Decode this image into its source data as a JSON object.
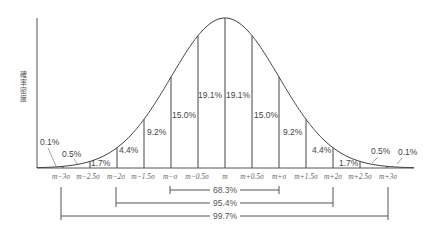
{
  "chart_data": {
    "type": "area",
    "title": "",
    "xlabel": "",
    "ylabel": "確率密度",
    "distribution": "normal",
    "x_ticks": [
      "m-3σ",
      "m-2.5σ",
      "m-2σ",
      "m-1.5σ",
      "m-σ",
      "m-0.5σ",
      "m",
      "m+0.5σ",
      "m+σ",
      "m+1.5σ",
      "m+2σ",
      "m+2.5σ",
      "m+3σ"
    ],
    "segments": [
      {
        "from": "<m-3σ",
        "to": "m-3σ",
        "percent": "0.1%"
      },
      {
        "from": "m-3σ",
        "to": "m-2.5σ",
        "percent": "0.5%"
      },
      {
        "from": "m-2.5σ",
        "to": "m-2σ",
        "percent": "1.7%"
      },
      {
        "from": "m-2σ",
        "to": "m-1.5σ",
        "percent": "4.4%"
      },
      {
        "from": "m-1.5σ",
        "to": "m-σ",
        "percent": "9.2%"
      },
      {
        "from": "m-σ",
        "to": "m-0.5σ",
        "percent": "15.0%"
      },
      {
        "from": "m-0.5σ",
        "to": "m",
        "percent": "19.1%"
      },
      {
        "from": "m",
        "to": "m+0.5σ",
        "percent": "19.1%"
      },
      {
        "from": "m+0.5σ",
        "to": "m+σ",
        "percent": "15.0%"
      },
      {
        "from": "m+σ",
        "to": "m+1.5σ",
        "percent": "9.2%"
      },
      {
        "from": "m+1.5σ",
        "to": "m+2σ",
        "percent": "4.4%"
      },
      {
        "from": "m+2σ",
        "to": "m+2.5σ",
        "percent": "1.7%"
      },
      {
        "from": "m+2.5σ",
        "to": "m+3σ",
        "percent": "0.5%"
      },
      {
        "from": "m+3σ",
        "to": ">m+3σ",
        "percent": "0.1%"
      }
    ],
    "ranges": [
      {
        "from": "m-σ",
        "to": "m+σ",
        "percent": "68.3%"
      },
      {
        "from": "m-2σ",
        "to": "m+2σ",
        "percent": "95.4%"
      },
      {
        "from": "m-3σ",
        "to": "m+3σ",
        "percent": "99.7%"
      }
    ],
    "grid": false,
    "legend": "none"
  },
  "labels": {
    "ylabel": "確率密度",
    "ticks": [
      "m−3σ",
      "m−2.5σ",
      "m−2σ",
      "m−1.5σ",
      "m−σ",
      "m−0.5σ",
      "m",
      "m+0.5σ",
      "m+σ",
      "m+1.5σ",
      "m+2σ",
      "m+2.5σ",
      "m+3σ"
    ],
    "pcts": [
      "0.1%",
      "0.5%",
      "1.7%",
      "4.4%",
      "9.2%",
      "15.0%",
      "19.1%",
      "19.1%",
      "15.0%",
      "9.2%",
      "4.4%",
      "1.7%",
      "0.5%",
      "0.1%"
    ],
    "ranges": [
      "68.3%",
      "95.4%",
      "99.7%"
    ]
  },
  "colors": {
    "line": "#444444",
    "text": "#444444"
  }
}
